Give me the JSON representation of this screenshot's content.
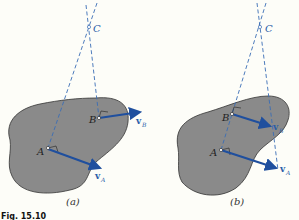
{
  "figure": {
    "caption": "Fig. 15.10",
    "colors": {
      "body_fill": "#8a8a8a",
      "body_stroke": "#333333",
      "vector": "#1f4f9e",
      "dashed_line": "#3a6db5",
      "background": "#fdfdf8"
    },
    "panels": [
      {
        "id": "a",
        "label": "(a)",
        "center_label": "C",
        "points": [
          {
            "name": "A"
          },
          {
            "name": "B"
          }
        ],
        "vectors": [
          {
            "name": "v",
            "subscript": "A"
          },
          {
            "name": "v",
            "subscript": "B"
          }
        ]
      },
      {
        "id": "b",
        "label": "(b)",
        "center_label": "C",
        "points": [
          {
            "name": "A"
          },
          {
            "name": "B"
          }
        ],
        "vectors": [
          {
            "name": "v",
            "subscript": "B"
          },
          {
            "name": "v",
            "subscript": "A"
          }
        ]
      }
    ]
  }
}
